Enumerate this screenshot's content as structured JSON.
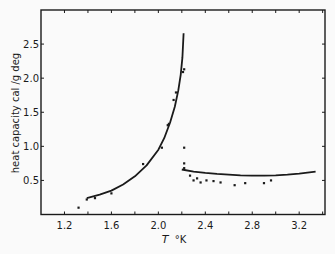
{
  "chart_data": {
    "type": "scatter",
    "title": "",
    "xlabel": "T °K",
    "ylabel": "heat capacity  cal /g deg",
    "xlim": [
      1.0,
      3.42
    ],
    "ylim": [
      0.0,
      3.0
    ],
    "x_ticks_major": [
      1.2,
      1.6,
      2.0,
      2.4,
      2.8,
      3.2
    ],
    "x_ticks_minor": [
      1.4,
      1.8,
      2.2,
      2.6,
      3.0,
      3.4
    ],
    "y_ticks": [
      0.5,
      1.0,
      1.5,
      2.0,
      2.5
    ],
    "y_tick_labels": [
      "0.5",
      "1.0",
      "1.5",
      "2.0",
      "2.5"
    ],
    "x_tick_labels": [
      "1.2",
      "1.6",
      "2.0",
      "2.4",
      "2.8",
      "3.2"
    ],
    "grid": false,
    "legend": null,
    "series": [
      {
        "name": "measured points",
        "kind": "scatter",
        "x": [
          1.32,
          1.39,
          1.46,
          1.6,
          1.87,
          2.03,
          2.08,
          2.09,
          2.13,
          2.15,
          2.21,
          2.22,
          2.22,
          2.22,
          2.22,
          2.27,
          2.3,
          2.33,
          2.36,
          2.41,
          2.47,
          2.53,
          2.65,
          2.74,
          2.9,
          2.96
        ],
        "y": [
          0.1,
          0.22,
          0.24,
          0.31,
          0.74,
          0.98,
          1.31,
          1.33,
          1.68,
          1.79,
          2.09,
          2.13,
          0.98,
          0.75,
          0.68,
          0.57,
          0.5,
          0.53,
          0.47,
          0.5,
          0.49,
          0.47,
          0.43,
          0.46,
          0.46,
          0.5
        ]
      },
      {
        "name": "fit below lambda point",
        "kind": "line",
        "x": [
          1.39,
          1.5,
          1.6,
          1.7,
          1.8,
          1.9,
          2.0,
          2.05,
          2.1,
          2.14,
          2.17,
          2.19,
          2.205,
          2.215
        ],
        "y": [
          0.24,
          0.29,
          0.35,
          0.44,
          0.56,
          0.72,
          0.95,
          1.12,
          1.35,
          1.58,
          1.82,
          2.05,
          2.3,
          2.66
        ]
      },
      {
        "name": "fit above lambda point",
        "kind": "line",
        "x": [
          2.2,
          2.3,
          2.4,
          2.5,
          2.6,
          2.7,
          2.8,
          2.9,
          3.0,
          3.1,
          3.2,
          3.34
        ],
        "y": [
          0.66,
          0.63,
          0.61,
          0.595,
          0.585,
          0.575,
          0.57,
          0.57,
          0.575,
          0.585,
          0.6,
          0.63
        ]
      }
    ]
  },
  "axes": {
    "xlabel_italic": "T",
    "xlabel_unit": "°K",
    "ylabel": "heat capacity  cal /g deg"
  },
  "colors": {
    "ink": "#1a1a1a",
    "background": "#fafafa"
  }
}
